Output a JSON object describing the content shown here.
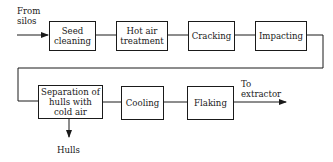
{
  "diagram": {
    "type": "process-flow",
    "input_label": "From silos",
    "output_label": "To extractor",
    "byproduct_label": "Hulls",
    "steps": [
      {
        "id": "seed-cleaning",
        "label": "Seed cleaning"
      },
      {
        "id": "hot-air-treatment",
        "label": "Hot air treatment"
      },
      {
        "id": "cracking",
        "label": "Cracking"
      },
      {
        "id": "impacting",
        "label": "Impacting"
      },
      {
        "id": "separation",
        "label": "Separation of hulls with cold air"
      },
      {
        "id": "cooling",
        "label": "Cooling"
      },
      {
        "id": "flaking",
        "label": "Flaking"
      }
    ],
    "edges": [
      [
        "input",
        "seed-cleaning"
      ],
      [
        "seed-cleaning",
        "hot-air-treatment"
      ],
      [
        "hot-air-treatment",
        "cracking"
      ],
      [
        "cracking",
        "impacting"
      ],
      [
        "impacting",
        "separation"
      ],
      [
        "separation",
        "cooling"
      ],
      [
        "cooling",
        "flaking"
      ],
      [
        "flaking",
        "output"
      ],
      [
        "separation",
        "hulls"
      ]
    ]
  },
  "labels": {
    "from_line1": "From",
    "from_line2": "silos",
    "to_line1": "To",
    "to_line2": "extractor",
    "hulls": "Hulls",
    "seed_line1": "Seed",
    "seed_line2": "cleaning",
    "hot_line1": "Hot air",
    "hot_line2": "treatment",
    "cracking": "Cracking",
    "impacting": "Impacting",
    "sep_line1": "Separation of",
    "sep_line2": "hulls with",
    "sep_line3": "cold air",
    "cooling": "Cooling",
    "flaking": "Flaking"
  }
}
